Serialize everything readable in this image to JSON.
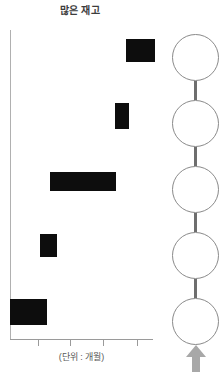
{
  "chart_data": {
    "type": "bar",
    "title": "많은 재고",
    "xlabel": "(단위 : 개월)",
    "ylabel": "",
    "orientation": "horizontal",
    "grid": false,
    "legend": null,
    "axis": {
      "x_tick_count": 4,
      "x_tick_positions_px": [
        38,
        70,
        103,
        137
      ],
      "x_tick_labels": [
        "",
        "",
        "",
        ""
      ],
      "y_tick_labels": [
        "",
        "",
        "",
        "",
        ""
      ]
    },
    "bar_color": "#0d0d0d",
    "note": "bar values are obscured / redacted as solid black blocks",
    "categories": [
      "1",
      "2",
      "3",
      "4",
      "5"
    ],
    "bars": [
      {
        "category": "1",
        "x_px": 126,
        "y_px": 39,
        "width_px": 29,
        "height_px": 23,
        "value": null
      },
      {
        "category": "2",
        "x_px": 115,
        "y_px": 103,
        "width_px": 14,
        "height_px": 26,
        "value": null
      },
      {
        "category": "3",
        "x_px": 50,
        "y_px": 172,
        "width_px": 66,
        "height_px": 19,
        "value": null
      },
      {
        "category": "4",
        "x_px": 40,
        "y_px": 234,
        "width_px": 17,
        "height_px": 23,
        "value": null
      },
      {
        "category": "5",
        "x_px": 10,
        "y_px": 299,
        "width_px": 37,
        "height_px": 26,
        "value": null
      }
    ]
  },
  "chain": {
    "node_count": 5,
    "node_color": "#8a8a8a",
    "connector_color": "#6e6e6e",
    "nodes": [
      {
        "label": "",
        "top_px": 34
      },
      {
        "label": "",
        "top_px": 100
      },
      {
        "label": "",
        "top_px": 166
      },
      {
        "label": "",
        "top_px": 232
      },
      {
        "label": "",
        "top_px": 298
      }
    ],
    "connectors": [
      {
        "top_px": 81,
        "height_px": 19
      },
      {
        "top_px": 147,
        "height_px": 19
      },
      {
        "top_px": 213,
        "height_px": 19
      },
      {
        "top_px": 279,
        "height_px": 19
      }
    ],
    "arrow": {
      "direction": "up",
      "color": "#a8a8a8",
      "icon": "arrow-up-icon"
    }
  }
}
